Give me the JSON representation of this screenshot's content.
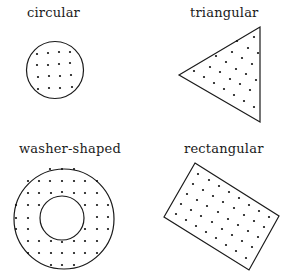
{
  "shapes": [
    {
      "id": "circular",
      "label": "circular"
    },
    {
      "id": "triangular",
      "label": "triangular"
    },
    {
      "id": "washer",
      "label": "washer-shaped"
    },
    {
      "id": "rectangular",
      "label": "rectangular"
    }
  ],
  "colors": {
    "stroke": "#1a1a1a",
    "dots": "#111111",
    "background": "#ffffff"
  }
}
